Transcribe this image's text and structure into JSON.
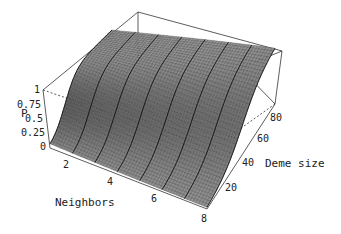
{
  "chart_data": {
    "type": "surface3d",
    "title": "",
    "xlabel": "Neighbors",
    "ylabel": "Deme size",
    "zlabel": "P",
    "x_ticks": [
      "2",
      "4",
      "6",
      "8"
    ],
    "y_ticks": [
      "20",
      "40",
      "60",
      "80"
    ],
    "z_ticks": [
      "0",
      "0.25",
      "0.5",
      "0.75",
      "1"
    ],
    "xlim": [
      1,
      8
    ],
    "ylim": [
      10,
      90
    ],
    "zlim": [
      0,
      1
    ],
    "grid": false,
    "box": true,
    "series": [
      {
        "name": "P at Neighbors=1",
        "deme_size": [
          10,
          20,
          30,
          40,
          50,
          60,
          70,
          80,
          90
        ],
        "values": [
          0.02,
          0.15,
          0.55,
          0.88,
          0.98,
          1.0,
          1.0,
          1.0,
          1.0
        ]
      },
      {
        "name": "P at Neighbors=4",
        "deme_size": [
          10,
          20,
          30,
          40,
          50,
          60,
          70,
          80,
          90
        ],
        "values": [
          0.0,
          0.03,
          0.2,
          0.55,
          0.85,
          0.96,
          0.99,
          1.0,
          1.0
        ]
      },
      {
        "name": "P at Neighbors=8",
        "deme_size": [
          10,
          20,
          30,
          40,
          50,
          60,
          70,
          80,
          90
        ],
        "values": [
          0.0,
          0.01,
          0.08,
          0.3,
          0.62,
          0.85,
          0.95,
          0.99,
          1.0
        ]
      }
    ]
  },
  "labels": {
    "xlabel": "Neighbors",
    "ylabel": "Deme size",
    "zlabel": "P",
    "x_ticks": [
      "2",
      "4",
      "6",
      "8"
    ],
    "y_ticks": [
      "20",
      "40",
      "60",
      "80"
    ],
    "z_ticks": [
      "0",
      "0.25",
      "0.5",
      "0.75",
      "1"
    ]
  }
}
